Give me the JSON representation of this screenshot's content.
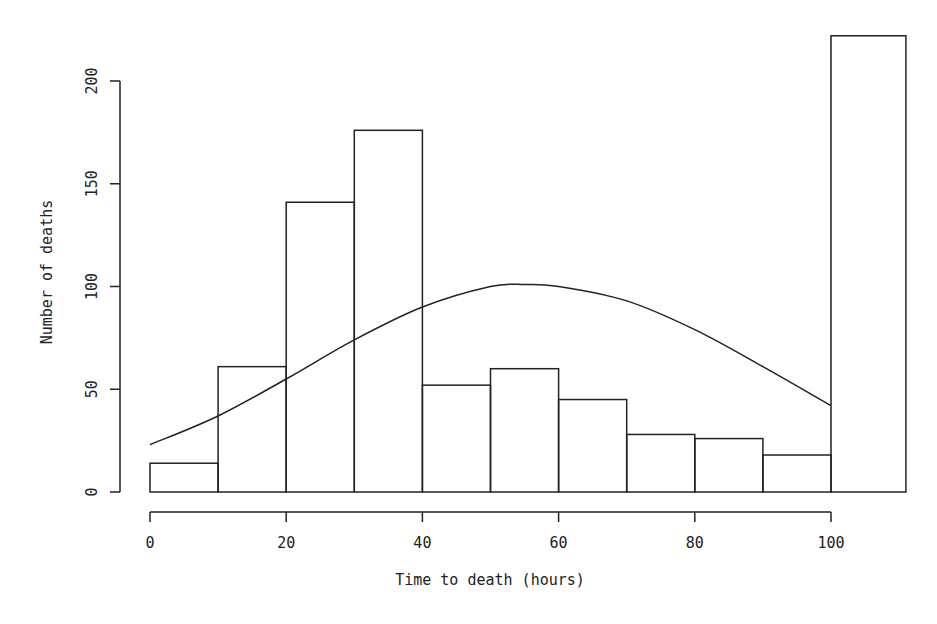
{
  "chart_data": {
    "type": "bar",
    "subtype": "histogram_with_fitted_curve",
    "title": "",
    "xlabel": "Time to death (hours)",
    "ylabel": "Number of deaths",
    "xlim": [
      0,
      110
    ],
    "ylim": [
      0,
      200
    ],
    "x_ticks": [
      0,
      20,
      40,
      60,
      80,
      100
    ],
    "y_ticks": [
      0,
      50,
      100,
      150,
      200
    ],
    "grid": false,
    "legend": null,
    "bins": [
      {
        "start": 0,
        "end": 10,
        "count": 14
      },
      {
        "start": 10,
        "end": 20,
        "count": 61
      },
      {
        "start": 20,
        "end": 30,
        "count": 141
      },
      {
        "start": 30,
        "end": 40,
        "count": 176
      },
      {
        "start": 40,
        "end": 50,
        "count": 52
      },
      {
        "start": 50,
        "end": 60,
        "count": 60
      },
      {
        "start": 60,
        "end": 70,
        "count": 45
      },
      {
        "start": 70,
        "end": 80,
        "count": 28
      },
      {
        "start": 80,
        "end": 90,
        "count": 26
      },
      {
        "start": 90,
        "end": 100,
        "count": 18
      },
      {
        "start": 100,
        "end": 111,
        "count": 222
      }
    ],
    "categories": [
      "0-10",
      "10-20",
      "20-30",
      "30-40",
      "40-50",
      "50-60",
      "60-70",
      "70-80",
      "80-90",
      "90-100",
      "100+"
    ],
    "values": [
      14,
      61,
      141,
      176,
      52,
      60,
      45,
      28,
      26,
      18,
      222
    ],
    "curve": {
      "name": "fitted normal curve",
      "x": [
        0,
        10,
        20,
        30,
        40,
        50,
        55,
        60,
        70,
        80,
        90,
        100
      ],
      "y": [
        23,
        37,
        55,
        74,
        90,
        100,
        101,
        100,
        93,
        79,
        61,
        42
      ]
    }
  }
}
